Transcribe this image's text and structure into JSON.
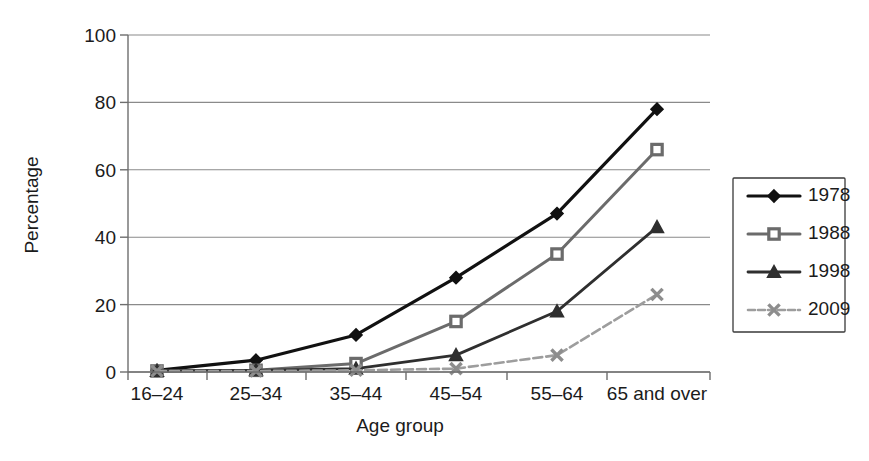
{
  "chart_data": {
    "type": "line",
    "title": "",
    "xlabel": "Age group",
    "ylabel": "Percentage",
    "categories": [
      "16–24",
      "25–34",
      "35–44",
      "45–54",
      "55–64",
      "65 and over"
    ],
    "ylim": [
      0,
      100
    ],
    "yticks": [
      0,
      20,
      40,
      60,
      80,
      100
    ],
    "ytick_labels": [
      "0",
      "20",
      "40",
      "60",
      "80",
      "100"
    ],
    "grid": "horizontal",
    "legend_position": "right",
    "series": [
      {
        "name": "1978",
        "values": [
          0.5,
          3.5,
          11,
          28,
          47,
          78
        ],
        "color": "#111111",
        "marker": "diamond",
        "marker_fill": "#111111",
        "line_style": "solid",
        "line_width": 3.2
      },
      {
        "name": "1988",
        "values": [
          0.3,
          0.5,
          2.5,
          15,
          35,
          66
        ],
        "color": "#6b6b6b",
        "marker": "square",
        "marker_fill": "#ffffff",
        "line_style": "solid",
        "line_width": 3.0
      },
      {
        "name": "1998",
        "values": [
          0.3,
          0.5,
          1,
          5,
          18,
          43
        ],
        "color": "#2f2f2f",
        "marker": "triangle",
        "marker_fill": "#2f2f2f",
        "line_style": "solid",
        "line_width": 2.8
      },
      {
        "name": "2009",
        "values": [
          0.3,
          0.3,
          0.5,
          1,
          5,
          23
        ],
        "color": "#9d9d9d",
        "marker": "cross",
        "marker_fill": "#8d8d8d",
        "line_style": "dashed",
        "line_width": 2.6
      }
    ]
  },
  "axes": {
    "y_axis_label": "Percentage",
    "x_axis_label": "Age group"
  },
  "legend": {
    "entries": [
      {
        "label": "1978"
      },
      {
        "label": "1988"
      },
      {
        "label": "1998"
      },
      {
        "label": "2009"
      }
    ]
  }
}
